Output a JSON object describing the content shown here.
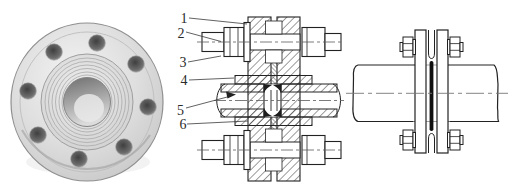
{
  "figure": {
    "type": "engineering-figure",
    "panels": {
      "photo": {
        "subject_label": ""
      },
      "cross_section": {
        "part_labels": [
          "1",
          "2",
          "3",
          "4",
          "5",
          "6"
        ]
      },
      "assembly": {
        "subject_label": ""
      }
    },
    "colors": {
      "ink": "#222222",
      "hatch": "#3a3a3a",
      "centerline": "#777777",
      "gasket_bar": "#101010",
      "paper": "#ffffff",
      "photo_face": "#d9d9d9",
      "photo_hole": "#4a4a4a"
    }
  },
  "labels": [
    "1",
    "2",
    "3",
    "4",
    "5",
    "6"
  ]
}
